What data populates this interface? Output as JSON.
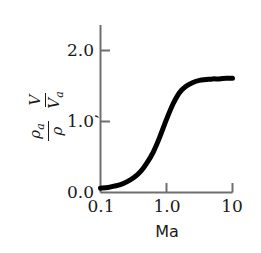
{
  "chart_data": {
    "type": "line",
    "title": "",
    "subtitle": "",
    "xlabel": "Ma",
    "ylabel_parts": {
      "frac1_num": "ρ",
      "frac1_num_sub": "a",
      "frac1_den": "ρ",
      "separator": ",",
      "frac2_num": "V",
      "frac2_den": "V",
      "frac2_den_sub": "a"
    },
    "ylabel_plain": "ρa/ρ , V/Va",
    "xscale": "log",
    "yscale": "linear",
    "xlim": [
      0.1,
      10
    ],
    "ylim": [
      0.0,
      2.3
    ],
    "xticks": [
      "0.1",
      "1.0",
      "10"
    ],
    "xtick_values": [
      0.1,
      1.0,
      10
    ],
    "yticks": [
      "0.0",
      "1.0",
      "2.0"
    ],
    "ytick_values": [
      0.0,
      1.0,
      2.0
    ],
    "grid": false,
    "legend": "none",
    "line_color": "#000000",
    "line_width": 5,
    "series": [
      {
        "name": "density-velocity ratio",
        "x": [
          0.1,
          0.13,
          0.16,
          0.2,
          0.25,
          0.32,
          0.4,
          0.5,
          0.63,
          0.79,
          1.0,
          1.26,
          1.58,
          2.0,
          2.51,
          3.16,
          3.98,
          5.01,
          6.31,
          7.94,
          10.0
        ],
        "y": [
          0.06,
          0.07,
          0.09,
          0.11,
          0.15,
          0.21,
          0.29,
          0.41,
          0.57,
          0.78,
          1.03,
          1.25,
          1.41,
          1.5,
          1.55,
          1.58,
          1.59,
          1.6,
          1.6,
          1.61,
          1.61
        ]
      }
    ],
    "annotations": []
  },
  "axes": {
    "x_axis_name": "x-axis",
    "y_axis_name": "y-axis"
  }
}
